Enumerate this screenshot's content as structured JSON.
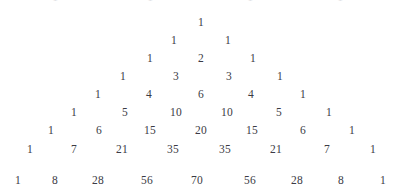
{
  "figure": {
    "name": "pascals-triangle",
    "background_color": "#ffffff",
    "text_color": "#3b3b44",
    "clipped_top_color": "#c9c9cf"
  },
  "chart_data": {
    "type": "table",
    "xlabel": "",
    "ylabel": "",
    "rows": [
      {
        "n": 0,
        "values": [
          1
        ]
      },
      {
        "n": 1,
        "values": [
          1,
          1
        ]
      },
      {
        "n": 2,
        "values": [
          1,
          2,
          1
        ]
      },
      {
        "n": 3,
        "values": [
          1,
          3,
          3,
          1
        ]
      },
      {
        "n": 4,
        "values": [
          1,
          4,
          6,
          4,
          1
        ]
      },
      {
        "n": 5,
        "values": [
          1,
          5,
          10,
          10,
          5,
          1
        ]
      },
      {
        "n": 6,
        "values": [
          1,
          6,
          15,
          20,
          15,
          6,
          1
        ]
      },
      {
        "n": 7,
        "values": [
          1,
          7,
          21,
          35,
          35,
          21,
          7,
          1
        ]
      },
      {
        "n": 8,
        "values": [
          1,
          8,
          28,
          56,
          70,
          56,
          28,
          8,
          1
        ]
      }
    ],
    "clipped_top_row": {
      "n": -1,
      "values": [
        "1",
        "1",
        "1",
        "1"
      ],
      "note": "faint partially cropped text along the top edge"
    }
  },
  "layout": {
    "row_y": [
      14,
      32,
      50,
      68,
      86,
      104,
      122,
      141,
      172
    ],
    "row_centers": [
      [
        201
      ],
      [
        174,
        228
      ],
      [
        150,
        201,
        253
      ],
      [
        123,
        176,
        229,
        280
      ],
      [
        98,
        149,
        201,
        251,
        303
      ],
      [
        74,
        125,
        176,
        227,
        279,
        329
      ],
      [
        51,
        99,
        150,
        201,
        252,
        303,
        352
      ],
      [
        30,
        74,
        122,
        173,
        225,
        276,
        327,
        373
      ],
      [
        18,
        55,
        98,
        147,
        197,
        250,
        297,
        341,
        383
      ]
    ],
    "clipped_positions": [
      55,
      150,
      250,
      340
    ]
  }
}
